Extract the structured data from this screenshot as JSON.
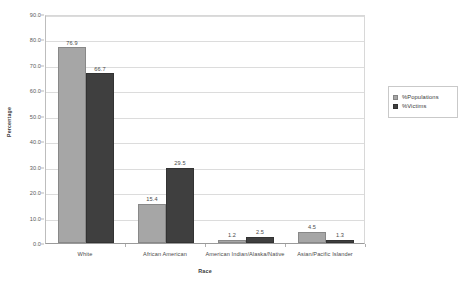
{
  "chart_data": {
    "type": "bar",
    "title": "",
    "xlabel": "Race",
    "ylabel": "Percentage",
    "categories": [
      "White",
      "African American",
      "American Indian/Alaska/Native",
      "Asian/Pacific Islander"
    ],
    "series": [
      {
        "name": "%Populations",
        "values": [
          76.9,
          15.4,
          1.2,
          4.5
        ],
        "color": "#a6a6a6"
      },
      {
        "name": "%Victims",
        "values": [
          66.7,
          29.5,
          2.5,
          1.3
        ],
        "color": "#3f3f3f"
      }
    ],
    "ylim": [
      0.0,
      90.0
    ],
    "ytick_labels": [
      "0.0",
      "10.0",
      "20.0",
      "30.0",
      "40.0",
      "50.0",
      "60.0",
      "70.0",
      "80.0",
      "90.0"
    ],
    "ytick_values": [
      0,
      10,
      20,
      30,
      40,
      50,
      60,
      70,
      80,
      90
    ],
    "grid": "horizontal",
    "legend_position": "right",
    "data_labels": [
      "76.9",
      "66.7",
      "15.4",
      "29.5",
      "1.2",
      "2.5",
      "4.5",
      "1.3"
    ]
  },
  "legend": {
    "items": [
      {
        "label": "%Populations"
      },
      {
        "label": "%Victims"
      }
    ]
  }
}
